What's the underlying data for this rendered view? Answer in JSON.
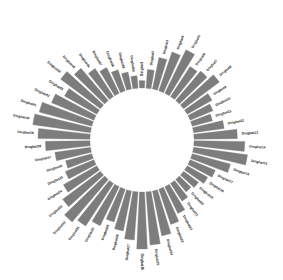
{
  "figure": {
    "background_color": "#ffffff",
    "width": 283,
    "height": 280
  },
  "chart_data": {
    "type": "bar",
    "subtype": "circular-radial-bar",
    "title": "",
    "subtitle": "",
    "xlabel": "",
    "ylabel": "",
    "legend": null,
    "legend_position": "none",
    "grid": false,
    "axis_visible": false,
    "tick_labels": [],
    "ylim": [
      0,
      100
    ],
    "polar": {
      "center_x": 142,
      "center_y": 140,
      "inner_radius": 52,
      "max_outer_radius": 114,
      "start_angle_deg": -90,
      "direction": "clockwise",
      "bar_width_ratio": 0.78
    },
    "style": {
      "bar_color": "#7d7d7d",
      "bar_edge_color": "#7d7d7d",
      "label_color": "#1a1a1a",
      "label_font_size": 3.4
    },
    "categories": [
      "Dingbat1",
      "Dingbat2",
      "Dingbat3",
      "Dingbat4",
      "Dingbat5",
      "Dingbat6",
      "Dingbat7",
      "Dingbat8",
      "Dingbat9",
      "Dingbat10",
      "Dingbat11",
      "Dingbat12",
      "Dingbat13",
      "Dingbat14",
      "Dingbat15",
      "Dingbat16",
      "Dingbat17",
      "Dingbat18",
      "Dingbat19",
      "Dingbat20",
      "Dingbat21",
      "Dingbat22",
      "Dingbat23",
      "Dingbat24",
      "Dingbat25",
      "Dingbat26",
      "Dingbat27",
      "Dingbat28",
      "Dingbat29",
      "Dingbat30",
      "Dingbat31",
      "Dingbat32",
      "Dingbat33",
      "Dingbat34",
      "Dingbat35",
      "Dingbat36",
      "Dingbat37",
      "Dingbat38",
      "Dingbat39",
      "Dingbat40",
      "Dingbat41",
      "Dingbat42",
      "Dingbat43",
      "Dingbat44",
      "Dingbat45",
      "Dingbat46",
      "Dingbat47",
      "Dingbat48",
      "Dingbat49",
      "Dingbat50"
    ],
    "values": [
      12,
      30,
      52,
      66,
      78,
      58,
      62,
      72,
      46,
      40,
      34,
      50,
      70,
      82,
      88,
      64,
      44,
      38,
      30,
      26,
      34,
      48,
      60,
      74,
      86,
      92,
      78,
      66,
      56,
      70,
      82,
      90,
      76,
      62,
      50,
      44,
      58,
      72,
      84,
      94,
      88,
      74,
      60,
      80,
      68,
      54,
      46,
      36,
      28,
      20
    ]
  }
}
